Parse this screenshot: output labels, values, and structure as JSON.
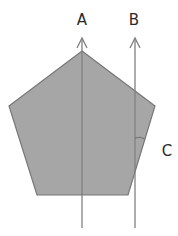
{
  "diagram": {
    "shape": "regular-pentagon",
    "fill_color": "#a6a6a6",
    "stroke_color": "#777777",
    "line_color": "#808080",
    "labels": {
      "a": "A",
      "b": "B",
      "c": "C"
    },
    "lines": [
      {
        "name": "A",
        "direction": "up-arrow",
        "passes_through": "apex"
      },
      {
        "name": "B",
        "direction": "up-arrow",
        "passes_through": "right side"
      }
    ],
    "angle_marker": "C"
  }
}
